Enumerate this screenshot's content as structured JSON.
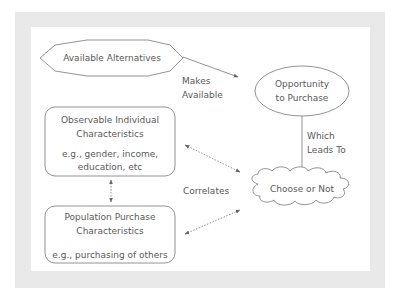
{
  "diagram": {
    "nodes": {
      "alternatives": {
        "label": "Available Alternatives",
        "shape": "octagon"
      },
      "opportunity": {
        "line1": "Opportunity",
        "line2": "to Purchase",
        "shape": "ellipse"
      },
      "individual": {
        "title1": "Observable Individual",
        "title2": "Characteristics",
        "ex1": "e.g., gender, income,",
        "ex2": "education, etc",
        "shape": "rounded-rect"
      },
      "population": {
        "title1": "Population Purchase",
        "title2": "Characteristics",
        "ex1": "e.g., purchasing of others",
        "shape": "rounded-rect"
      },
      "choose": {
        "label": "Choose or Not",
        "shape": "cloud"
      }
    },
    "edges": {
      "makes_available": {
        "line1": "Makes",
        "line2": "Available",
        "style": "solid"
      },
      "leads_to": {
        "line1": "Which",
        "line2": "Leads To",
        "style": "solid"
      },
      "correlates": {
        "label": "Correlates",
        "style": "dotted-bidirectional"
      }
    },
    "colors": {
      "frame": "#e8e8e8",
      "panel": "#ffffff",
      "stroke": "#666666",
      "text": "#5a5a5a"
    }
  }
}
